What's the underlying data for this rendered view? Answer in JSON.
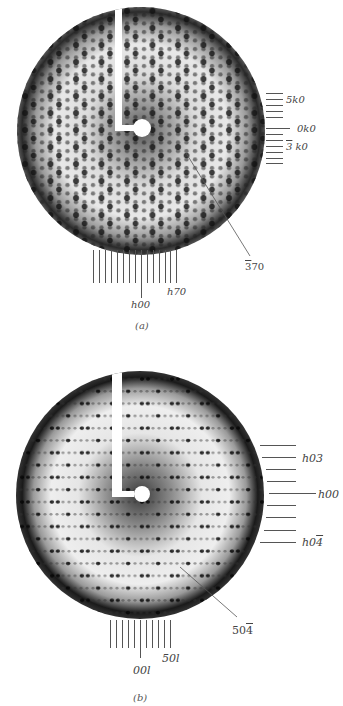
{
  "figure": {
    "panels": [
      {
        "id": "a",
        "caption": "(a)",
        "right_labels": {
          "top": "5k0",
          "middle": "0k0",
          "bottom_num": "3",
          "bottom_rest": " k0"
        },
        "bottom_labels": {
          "center": "h00",
          "right": "h70"
        },
        "pointer_label_num": "3",
        "pointer_label_rest": "70"
      },
      {
        "id": "b",
        "caption": "(b)",
        "right_labels": {
          "top": "h03",
          "middle": "h00",
          "bottom_rest": "h0",
          "bottom_num": "4"
        },
        "bottom_labels": {
          "center": "00l",
          "right": "50l"
        },
        "pointer_label_rest": "50",
        "pointer_label_num": "4"
      }
    ]
  }
}
